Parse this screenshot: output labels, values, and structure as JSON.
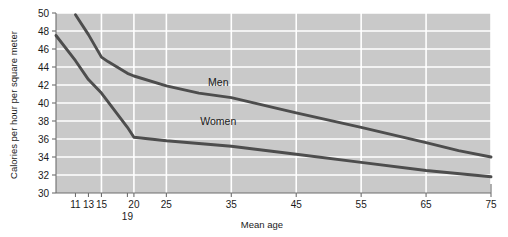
{
  "chart_data": {
    "type": "line",
    "title": "",
    "xlabel": "Mean age",
    "ylabel": "Calories per hour per square meter",
    "xlim": [
      8,
      75
    ],
    "ylim": [
      30,
      50
    ],
    "grid": true,
    "legend_position": "inline-annotation",
    "xticks": [
      11,
      13,
      15,
      19,
      20,
      25,
      35,
      45,
      55,
      65,
      75
    ],
    "xtick_labels": [
      "11",
      "13",
      "15",
      "19",
      "20",
      "25",
      "35",
      "45",
      "55",
      "65",
      "75"
    ],
    "yticks": [
      30,
      32,
      34,
      36,
      38,
      40,
      42,
      44,
      46,
      48,
      50
    ],
    "ytick_labels": [
      "30",
      "32",
      "34",
      "36",
      "38",
      "40",
      "42",
      "44",
      "46",
      "48",
      "50"
    ],
    "gridlines_x": [
      15,
      20,
      25,
      35,
      45,
      55,
      65,
      75
    ],
    "series": [
      {
        "name": "Men",
        "label_x": 33,
        "label_y": 41.9,
        "color": "#4d4d4d",
        "x": [
          11,
          13,
          15,
          16,
          19,
          20,
          25,
          30,
          35,
          45,
          55,
          65,
          70,
          75
        ],
        "values": [
          49.8,
          47.6,
          45.1,
          44.6,
          43.3,
          43.0,
          41.9,
          41.1,
          40.6,
          38.9,
          37.3,
          35.6,
          34.7,
          34.0
        ]
      },
      {
        "name": "Women",
        "label_x": 33,
        "label_y": 37.6,
        "color": "#4d4d4d",
        "x": [
          8,
          11,
          13,
          15,
          19,
          20,
          25,
          30,
          35,
          45,
          55,
          65,
          75
        ],
        "values": [
          47.5,
          44.7,
          42.6,
          41.1,
          37.3,
          36.2,
          35.8,
          35.5,
          35.2,
          34.3,
          33.4,
          32.5,
          31.8
        ]
      }
    ]
  },
  "style": {
    "plot_background": "#c9c9c9",
    "gridline_color": "#ffffff",
    "axis_color": "#6e6e6e",
    "text_color": "#1a1a1a",
    "page_background": "#ffffff"
  }
}
